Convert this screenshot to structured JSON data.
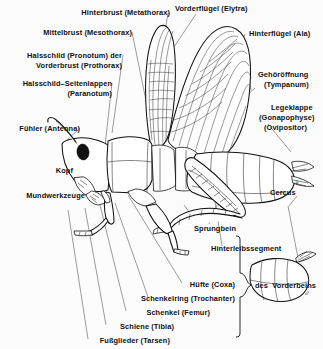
{
  "figure": {
    "background_color": "#fcfcfc",
    "ink_color": "#111111",
    "leader_line_color": "#4a4a4a"
  },
  "labels": {
    "hinterbrust": "Hinterbrust (Metathorax)",
    "mittelbrust": "Mittelbrust (Mesothorax)",
    "halsschild_1": "Halsschild (Pronotum) der",
    "halsschild_2": "Vorderbrust (Prothorax)",
    "paranotum_1": "Halsschild–Seitenlappen",
    "paranotum_2": "(Paranotum)",
    "fuehler": "Fühler (Antenna)",
    "kopf": "Kopf",
    "mundwerkzeuge": "Mundwerkzeuge",
    "vorderfluegel": "Vorderflügel (Elytra)",
    "hinterfluegel": "Hinterflügel (Ala)",
    "gehoeroeffnung_1": "Gehöröffnung",
    "gehoeroeffnung_2": "(Tympanum)",
    "legeklappe_1": "Legeklappe",
    "legeklappe_2": "(Gonapophyse)",
    "legeklappe_3": "(Ovipositor)",
    "cercus": "Cercus",
    "sprungbein": "Sprungbein",
    "hinterleibssegment": "Hinterleibssegment",
    "huefte": "Hüfte (Coxa)",
    "schenkelring": "Schenkelring (Trochanter)",
    "schenkel": "Schenkel (Femur)",
    "schiene": "Schiene (Tibia)",
    "fussglieder": "Fußglieder (Tarsen)",
    "des_vorderbeins": "des  Vorderbeins"
  },
  "symbols": {
    "female": "♀",
    "male": "♂"
  }
}
